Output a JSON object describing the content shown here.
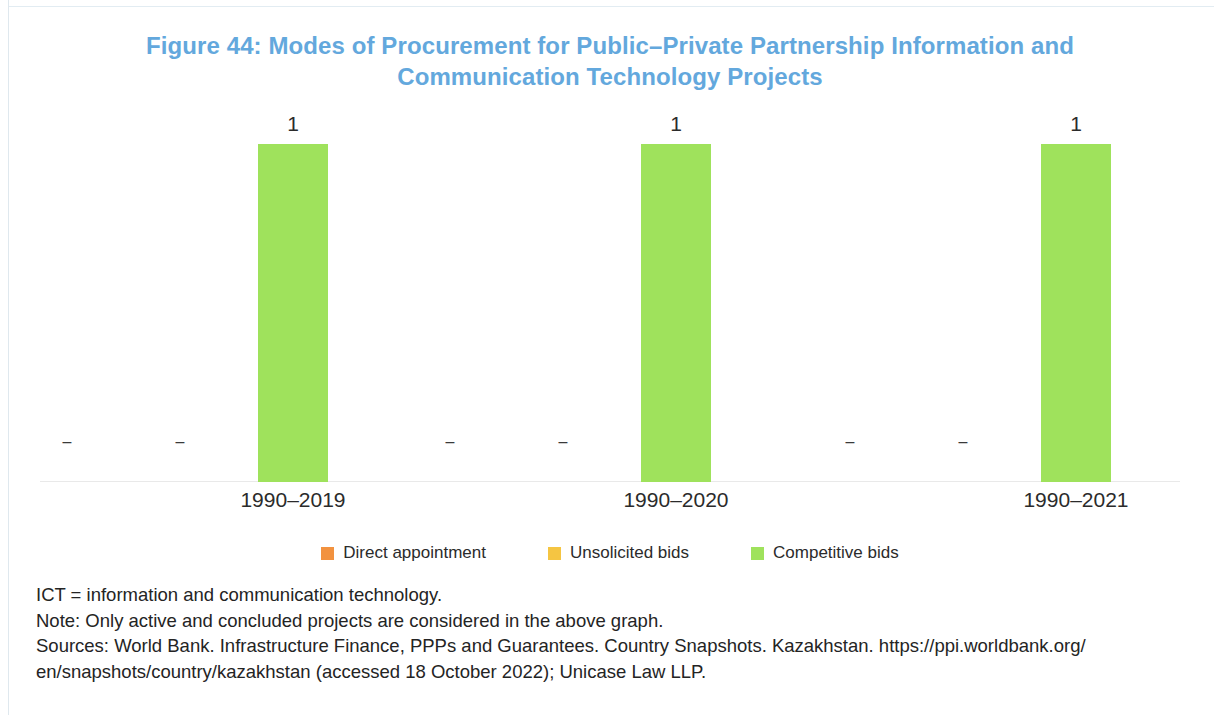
{
  "figure": {
    "title": "Figure 44: Modes of Procurement for Public–Private Partnership Information and Communication Technology Projects",
    "title_color": "#63A8DD"
  },
  "legend": {
    "position": "bottom-center",
    "items": [
      {
        "label": "Direct appointment",
        "color": "#F2923F",
        "key": "direct"
      },
      {
        "label": "Unsolicited bids",
        "color": "#F5C542",
        "key": "unsolicited"
      },
      {
        "label": "Competitive bids",
        "color": "#9FE25C",
        "key": "competitive"
      }
    ]
  },
  "zero_marker": "–",
  "notes": {
    "abbreviation": "ICT = information and communication technology.",
    "note": "Note: Only active and concluded projects are considered in the above graph.",
    "sources_line1": "Sources: World Bank. Infrastructure Finance, PPPs and Guarantees. Country Snapshots. Kazakhstan. https://ppi.worldbank.org/",
    "sources_line2": "en/snapshots/country/kazakhstan (accessed 18 October 2022); Unicase Law LLP."
  },
  "chart_data": {
    "type": "bar",
    "title": "Figure 44: Modes of Procurement for Public–Private Partnership Information and Communication Technology Projects",
    "subtitle": "",
    "xlabel": "",
    "ylabel": "",
    "categories": [
      "1990–2019",
      "1990–2020",
      "1990–2021"
    ],
    "series": [
      {
        "name": "Direct appointment",
        "color": "#F2923F",
        "values": [
          0,
          0,
          0
        ],
        "labels": [
          "–",
          "–",
          "–"
        ]
      },
      {
        "name": "Unsolicited bids",
        "color": "#F5C542",
        "values": [
          0,
          0,
          0
        ],
        "labels": [
          "–",
          "–",
          "–"
        ]
      },
      {
        "name": "Competitive bids",
        "color": "#9FE25C",
        "values": [
          1,
          1,
          1
        ],
        "labels": [
          "1",
          "1",
          "1"
        ]
      }
    ],
    "ylim": [
      0,
      1.1
    ],
    "grid": false,
    "legend_position": "bottom"
  }
}
